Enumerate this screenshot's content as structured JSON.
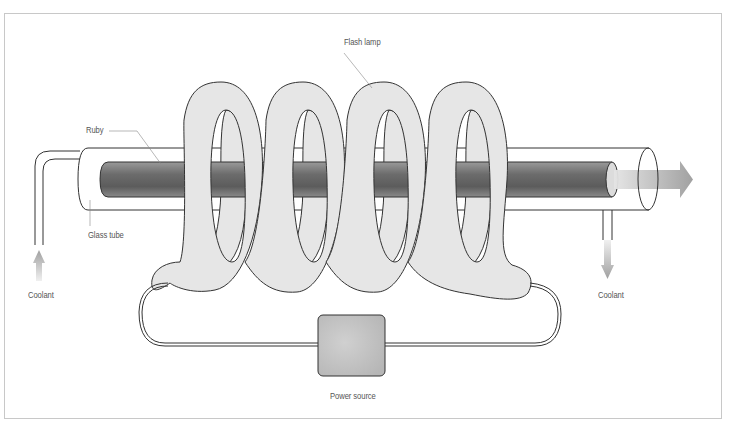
{
  "diagram": {
    "labels": {
      "flash_lamp": "Flash lamp",
      "ruby": "Ruby",
      "glass_tube": "Glass tube",
      "coolant_in": "Coolant",
      "coolant_out": "Coolant",
      "power_source": "Power source"
    },
    "colors": {
      "frame": "#c8c8c8",
      "outline": "#333333",
      "ruby_dark": "#6f6f6f",
      "ruby_light": "#b5b5b5",
      "lamp_fill": "#e6e6e6",
      "arrow": "#a9a9a9",
      "power_box": "#c4c4c4",
      "label_text": "#555555"
    },
    "coil_loops": 4
  }
}
